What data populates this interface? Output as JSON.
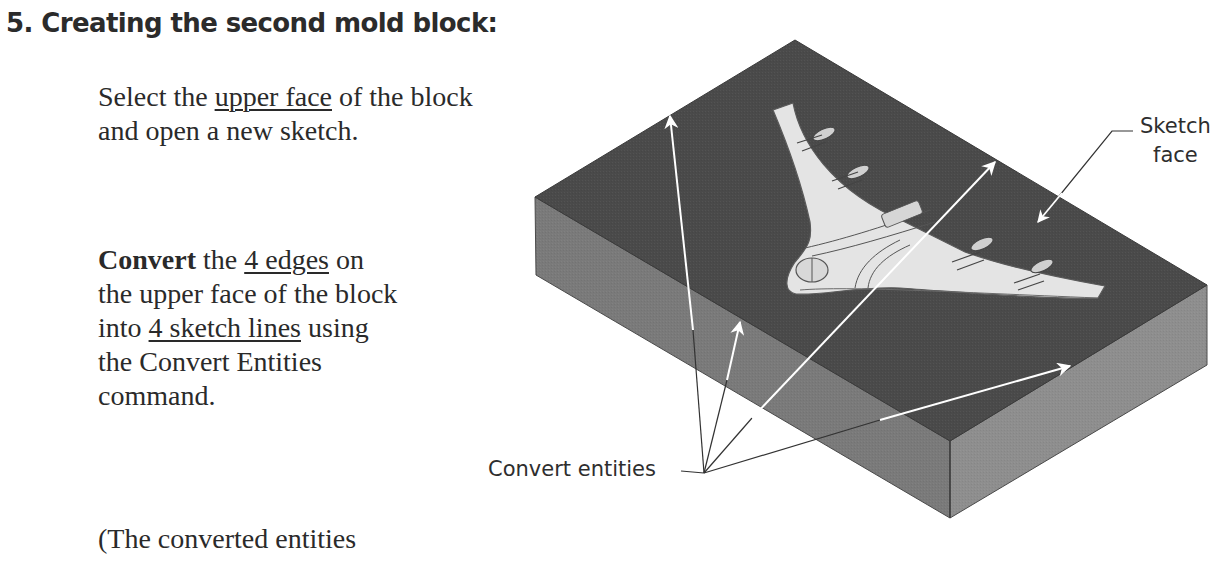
{
  "heading": {
    "title": "5. Creating the second mold block:"
  },
  "instructions": {
    "p1": {
      "t1": "Select the ",
      "u1": "upper face",
      "t2": " of the block",
      "t3": "and open a new sketch."
    },
    "p2": {
      "bold": "Convert",
      "t1": " the ",
      "u1": "4 edges",
      "t2": " on",
      "t3": "the upper face of the block",
      "t4": "into ",
      "u2": "4 sketch lines",
      "t5": " using",
      "t6": "the Convert Entities",
      "t7": "command."
    },
    "p3": {
      "t1": "(The converted entities"
    }
  },
  "figure": {
    "callouts": {
      "sketch_face_line1": "Sketch",
      "sketch_face_line2": "face",
      "convert_entities": "Convert entities"
    },
    "colors": {
      "top_face": "#4a4a4a",
      "left_face": "#7a7a7a",
      "right_face": "#8e8e8e",
      "edge": "#555555",
      "airplane": "#e4e4e4",
      "arrow_on_block": "#ffffff",
      "leader_line": "#333333"
    }
  }
}
